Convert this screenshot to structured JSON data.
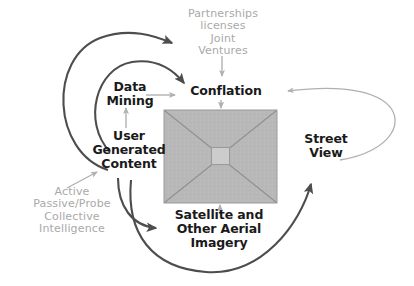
{
  "diagram": {
    "background_color": "#ffffff",
    "nodes": {
      "partnerships": {
        "text": "Partnerships\nlicenses\nJoint\nVentures",
        "style": "muted",
        "color": "#a9a9a9"
      },
      "conflation": {
        "text": "Conflation",
        "style": "bold",
        "color": "#1a1a1a"
      },
      "data_mining": {
        "text": "Data\nMining",
        "style": "bold",
        "color": "#1a1a1a"
      },
      "user_generated_content": {
        "text": "User\nGenerated\nContent",
        "style": "bold",
        "color": "#1a1a1a"
      },
      "active_passive": {
        "text": "Active\nPassive/Probe\nCollective\nIntelligence",
        "style": "muted",
        "color": "#a9a9a9"
      },
      "satellite": {
        "text": "Satellite and\nOther Aerial\nImagery",
        "style": "bold",
        "color": "#1a1a1a"
      },
      "street_view": {
        "text": "Street\nView",
        "style": "bold",
        "color": "#1a1a1a"
      }
    },
    "imagery_box": {
      "fill_color": "#b8b8b8",
      "stroke_color": "#9a9a9a",
      "diagonal_color": "#8f8f8f",
      "center_square_fill": "#cccccc",
      "center_square_stroke": "#9a9a9a"
    },
    "connectors": {
      "thick_color": "#4d4d4d",
      "thin_color": "#b0b0b0",
      "items": [
        {
          "name": "user-content-to-partnerships",
          "weight": "thick"
        },
        {
          "name": "user-content-to-conflation",
          "weight": "thick"
        },
        {
          "name": "user-content-to-satellite",
          "weight": "thick"
        },
        {
          "name": "user-content-to-street-view",
          "weight": "thick"
        },
        {
          "name": "partnerships-to-conflation",
          "weight": "thin"
        },
        {
          "name": "data-mining-to-conflation",
          "weight": "thin"
        },
        {
          "name": "conflation-to-imagery",
          "weight": "thin"
        },
        {
          "name": "user-content-to-data-mining",
          "weight": "thin"
        },
        {
          "name": "active-passive-to-user-content",
          "weight": "thin"
        },
        {
          "name": "imagery-to-satellite",
          "weight": "thin"
        },
        {
          "name": "street-view-to-conflation",
          "weight": "thin"
        }
      ]
    }
  }
}
